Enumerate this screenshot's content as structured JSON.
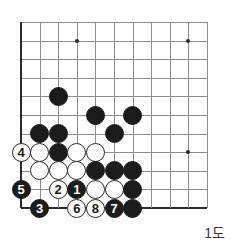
{
  "figure": {
    "caption": "1도",
    "kind": "go-board-diagram"
  },
  "board": {
    "origin_x": 21,
    "origin_y": 22,
    "spacing": 18.6,
    "cols": 11,
    "rows": 11,
    "edges": {
      "left": true,
      "bottom": true,
      "top": false,
      "right": false
    },
    "line_color": "#8d8d8d",
    "edge_color": "#2b2b2b",
    "star_points": [
      {
        "col": 3,
        "row": 1
      },
      {
        "col": 9,
        "row": 1
      },
      {
        "col": 9,
        "row": 7
      }
    ],
    "stones": [
      {
        "col": 2,
        "row": 4,
        "color": "black",
        "label": ""
      },
      {
        "col": 4,
        "row": 5,
        "color": "black",
        "label": ""
      },
      {
        "col": 6,
        "row": 5,
        "color": "black",
        "label": ""
      },
      {
        "col": 5,
        "row": 6,
        "color": "black",
        "label": ""
      },
      {
        "col": 1,
        "row": 6,
        "color": "black",
        "label": ""
      },
      {
        "col": 2,
        "row": 6,
        "color": "black",
        "label": ""
      },
      {
        "col": 0,
        "row": 7,
        "color": "white",
        "label": "4"
      },
      {
        "col": 1,
        "row": 7,
        "color": "white",
        "label": ""
      },
      {
        "col": 2,
        "row": 7,
        "color": "black",
        "label": ""
      },
      {
        "col": 3,
        "row": 7,
        "color": "white",
        "label": ""
      },
      {
        "col": 4,
        "row": 7,
        "color": "white",
        "label": ""
      },
      {
        "col": 1,
        "row": 8,
        "color": "white",
        "label": ""
      },
      {
        "col": 2,
        "row": 8,
        "color": "white",
        "label": ""
      },
      {
        "col": 3,
        "row": 8,
        "color": "white",
        "label": ""
      },
      {
        "col": 4,
        "row": 8,
        "color": "black",
        "label": ""
      },
      {
        "col": 5,
        "row": 8,
        "color": "black",
        "label": ""
      },
      {
        "col": 6,
        "row": 8,
        "color": "black",
        "label": ""
      },
      {
        "col": 0,
        "row": 9,
        "color": "black",
        "label": "5"
      },
      {
        "col": 2,
        "row": 9,
        "color": "white",
        "label": "2"
      },
      {
        "col": 3,
        "row": 9,
        "color": "black",
        "label": "1"
      },
      {
        "col": 4,
        "row": 9,
        "color": "white",
        "label": ""
      },
      {
        "col": 5,
        "row": 9,
        "color": "white",
        "label": ""
      },
      {
        "col": 6,
        "row": 9,
        "color": "black",
        "label": ""
      },
      {
        "col": 1,
        "row": 10,
        "color": "black",
        "label": "3"
      },
      {
        "col": 3,
        "row": 10,
        "color": "white",
        "label": "6"
      },
      {
        "col": 4,
        "row": 10,
        "color": "white",
        "label": "8"
      },
      {
        "col": 5,
        "row": 10,
        "color": "black",
        "label": "7"
      },
      {
        "col": 6,
        "row": 10,
        "color": "black",
        "label": ""
      }
    ]
  }
}
